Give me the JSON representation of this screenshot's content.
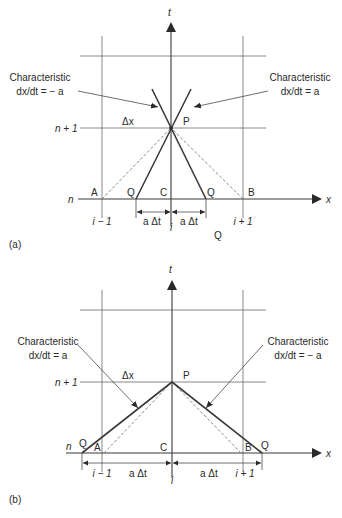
{
  "figure_a": {
    "caption": "(a)",
    "t_axis_label": "t",
    "x_axis_label": "x",
    "row_labels": {
      "n": "n",
      "n_plus_1": "n + 1"
    },
    "col_labels": {
      "i_minus_1": "i − 1",
      "i": "i",
      "i_plus_1": "i + 1"
    },
    "left_annotation": {
      "line1": "Characteristic",
      "line2": "dx/dt = − a"
    },
    "right_annotation": {
      "line1": "Characteristic",
      "line2": "dx/dt = a"
    },
    "delta_x": "Δx",
    "points": {
      "P": "P",
      "A": "A",
      "B": "B",
      "C": "C",
      "Q_left": "Q",
      "Q_right": "Q",
      "Q_below": "Q"
    },
    "dim_left": "a Δt",
    "dim_right": "a Δt"
  },
  "figure_b": {
    "caption": "(b)",
    "t_axis_label": "t",
    "x_axis_label": "x",
    "row_labels": {
      "n": "n",
      "n_plus_1": "n + 1"
    },
    "col_labels": {
      "i_minus_1": "i − 1",
      "i": "i",
      "i_plus_1": "i + 1"
    },
    "left_annotation": {
      "line1": "Characteristic",
      "line2": "dx/dt = a"
    },
    "right_annotation": {
      "line1": "Characteristic",
      "line2": "dx/dt = − a"
    },
    "delta_x": "Δx",
    "points": {
      "P": "P",
      "A": "A",
      "B": "B",
      "C": "C",
      "Q_left": "Q",
      "Q_right": "Q"
    },
    "dim_left": "a Δt",
    "dim_right": "a Δt"
  }
}
